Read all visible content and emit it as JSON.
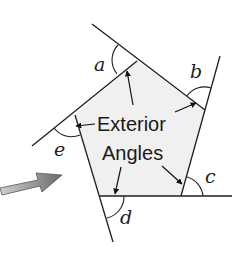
{
  "diagram": {
    "title_line1": "Exterior",
    "title_line2": "Angles",
    "angle_labels": {
      "a": "a",
      "b": "b",
      "c": "c",
      "d": "d",
      "e": "e"
    },
    "colors": {
      "pentagon_fill": "#f0f0f0",
      "line": "#1e1e1e",
      "arrow_gray": "#7a7a7a",
      "background": "#ffffff"
    },
    "shape": "pentagon"
  }
}
